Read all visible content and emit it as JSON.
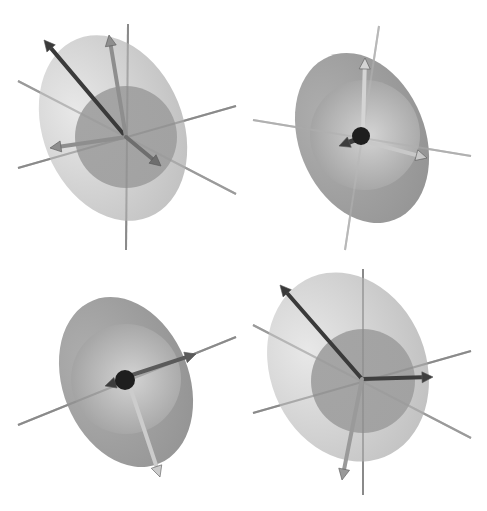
{
  "figure": {
    "width": 487,
    "height": 511,
    "background": "#ffffff",
    "panels": [
      {
        "id": "top-left",
        "x": 0,
        "y": 0,
        "w": 243,
        "h": 255,
        "ellipsoid": {
          "cx": 113,
          "cy": 128,
          "rx": 70,
          "ry": 96,
          "rot": -22,
          "fill": "#bdbdbd",
          "highlight": "#e6e6e6"
        },
        "sphere": {
          "cx": 126,
          "cy": 137,
          "r": 51,
          "fill": "#9e9e9e"
        },
        "center_ball": null,
        "axes": [
          {
            "x1": 128,
            "y1": 24,
            "x2": 126,
            "y2": 250,
            "color": "#8a8a8a"
          },
          {
            "x1": 18,
            "y1": 81,
            "x2": 236,
            "y2": 194,
            "color": "#9a9a9a"
          },
          {
            "x1": 18,
            "y1": 168,
            "x2": 236,
            "y2": 106,
            "color": "#8a8a8a"
          }
        ],
        "arrows": [
          {
            "x1": 126,
            "y1": 137,
            "x2": 44,
            "y2": 40,
            "color": "#3a3a3a",
            "width": 4
          },
          {
            "x1": 126,
            "y1": 137,
            "x2": 109,
            "y2": 35,
            "color": "#8e8e8e",
            "width": 4
          },
          {
            "x1": 126,
            "y1": 137,
            "x2": 50,
            "y2": 148,
            "color": "#8e8e8e",
            "width": 4
          },
          {
            "x1": 126,
            "y1": 137,
            "x2": 161,
            "y2": 166,
            "color": "#6e6e6e",
            "width": 4
          }
        ]
      },
      {
        "id": "top-right",
        "x": 243,
        "y": 0,
        "w": 244,
        "h": 255,
        "ellipsoid": {
          "cx": 119,
          "cy": 138,
          "rx": 63,
          "ry": 88,
          "rot": -22,
          "fill": "#8c8c8c",
          "highlight": "#a8a8a8"
        },
        "sphere": {
          "cx": 122,
          "cy": 135,
          "r": 55,
          "fill": "#9a9a9a",
          "highlight": "#d8d8d8"
        },
        "center_ball": {
          "cx": 118,
          "cy": 136,
          "r": 9,
          "fill": "#1e1e1e"
        },
        "axes": [
          {
            "x1": 136,
            "y1": 26,
            "x2": 102,
            "y2": 250,
            "color": "#b8b8b8"
          },
          {
            "x1": 10,
            "y1": 120,
            "x2": 228,
            "y2": 156,
            "color": "#b0b0b0"
          }
        ],
        "arrows": [
          {
            "x1": 120,
            "y1": 130,
            "x2": 122,
            "y2": 58,
            "color": "#d4d4d4",
            "width": 4
          },
          {
            "x1": 124,
            "y1": 142,
            "x2": 184,
            "y2": 158,
            "color": "#c8c8c8",
            "width": 4
          },
          {
            "x1": 112,
            "y1": 140,
            "x2": 96,
            "y2": 146,
            "color": "#3c3c3c",
            "width": 5
          }
        ]
      },
      {
        "id": "bottom-left",
        "x": 0,
        "y": 255,
        "w": 243,
        "h": 256,
        "ellipsoid": {
          "cx": 126,
          "cy": 127,
          "rx": 63,
          "ry": 88,
          "rot": -22,
          "fill": "#8c8c8c",
          "highlight": "#a8a8a8"
        },
        "sphere": {
          "cx": 126,
          "cy": 124,
          "r": 55,
          "fill": "#9a9a9a",
          "highlight": "#d8d8d8"
        },
        "center_ball": {
          "cx": 125,
          "cy": 125,
          "r": 10,
          "fill": "#1e1e1e"
        },
        "axes": [
          {
            "x1": 18,
            "y1": 170,
            "x2": 236,
            "y2": 82,
            "color": "#8a8a8a"
          }
        ],
        "arrows": [
          {
            "x1": 132,
            "y1": 120,
            "x2": 196,
            "y2": 99,
            "color": "#5a5a5a",
            "width": 4
          },
          {
            "x1": 130,
            "y1": 132,
            "x2": 160,
            "y2": 222,
            "color": "#cccccc",
            "width": 4
          },
          {
            "x1": 118,
            "y1": 127,
            "x2": 105,
            "y2": 131,
            "color": "#3c3c3c",
            "width": 5
          }
        ]
      },
      {
        "id": "bottom-right",
        "x": 243,
        "y": 255,
        "w": 244,
        "h": 256,
        "ellipsoid": {
          "cx": 105,
          "cy": 112,
          "rx": 78,
          "ry": 97,
          "rot": -22,
          "fill": "#bdbdbd",
          "highlight": "#e6e6e6"
        },
        "sphere": {
          "cx": 120,
          "cy": 126,
          "r": 52,
          "fill": "#9e9e9e"
        },
        "center_ball": null,
        "axes": [
          {
            "x1": 120,
            "y1": 14,
            "x2": 120,
            "y2": 240,
            "color": "#8a8a8a"
          },
          {
            "x1": 10,
            "y1": 70,
            "x2": 228,
            "y2": 183,
            "color": "#9a9a9a"
          },
          {
            "x1": 10,
            "y1": 158,
            "x2": 228,
            "y2": 96,
            "color": "#8a8a8a"
          }
        ],
        "arrows": [
          {
            "x1": 119,
            "y1": 124,
            "x2": 37,
            "y2": 30,
            "color": "#3a3a3a",
            "width": 4
          },
          {
            "x1": 119,
            "y1": 124,
            "x2": 190,
            "y2": 122,
            "color": "#3e3e3e",
            "width": 4
          },
          {
            "x1": 119,
            "y1": 124,
            "x2": 99,
            "y2": 225,
            "color": "#9a9a9a",
            "width": 4
          }
        ]
      }
    ]
  }
}
